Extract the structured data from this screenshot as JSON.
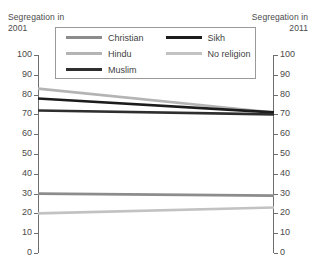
{
  "axes": {
    "left_caption_line1": "Segregation in",
    "left_caption_line2": "2001",
    "right_caption_line1": "Segregation in",
    "right_caption_line2": "2011"
  },
  "legend": {
    "items": [
      {
        "label": "Christian",
        "color": "#8c8c8c"
      },
      {
        "label": "Sikh",
        "color": "#1c1c1c"
      },
      {
        "label": "Hindu",
        "color": "#b4b4b4"
      },
      {
        "label": "No religion",
        "color": "#c2c2c2"
      },
      {
        "label": "Muslim",
        "color": "#2e2e2e"
      }
    ]
  },
  "chart_data": {
    "type": "line",
    "title": "",
    "subtitle": "",
    "xlabel": "",
    "ylabel": "",
    "x": [
      "2001",
      "2011"
    ],
    "categories": [
      "2001",
      "2011"
    ],
    "ylim": [
      0,
      100
    ],
    "yticks": [
      0,
      10,
      20,
      30,
      40,
      50,
      60,
      70,
      80,
      90,
      100
    ],
    "ytick_labels": [
      "0",
      "10",
      "20",
      "30",
      "40",
      "50",
      "60",
      "70",
      "80",
      "90",
      "100"
    ],
    "y2lim": [
      0,
      100
    ],
    "y2ticks": [
      0,
      10,
      20,
      30,
      40,
      50,
      60,
      70,
      80,
      90,
      100
    ],
    "y2tick_labels": [
      "0",
      "10",
      "20",
      "30",
      "40",
      "50",
      "60",
      "70",
      "80",
      "90",
      "100"
    ],
    "grid": false,
    "legend_position": "top-inside-boxed",
    "series": [
      {
        "name": "Hindu",
        "color": "#b4b4b4",
        "width": 2.6,
        "values": [
          83,
          71
        ]
      },
      {
        "name": "Sikh",
        "color": "#1c1c1c",
        "width": 2.6,
        "values": [
          78,
          71
        ]
      },
      {
        "name": "Muslim",
        "color": "#2e2e2e",
        "width": 2.6,
        "values": [
          72,
          70
        ]
      },
      {
        "name": "Christian",
        "color": "#8c8c8c",
        "width": 2.6,
        "values": [
          30,
          29
        ]
      },
      {
        "name": "No religion",
        "color": "#c2c2c2",
        "width": 2.6,
        "values": [
          20,
          23
        ]
      }
    ]
  }
}
